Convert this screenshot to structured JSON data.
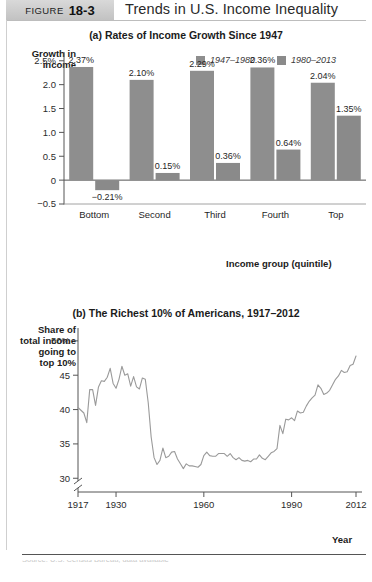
{
  "figure": {
    "tag_word": "FIGURE",
    "tag_number": "18-3",
    "title": "Trends in U.S. Income Inequality"
  },
  "panel_a": {
    "title": "(a) Rates of Income Growth Since 1947",
    "ylabel": "Growth in\nincome",
    "ylabel_line1": "Growth in",
    "ylabel_line2": "income",
    "xlabel": "Income group (quintile)",
    "legend": [
      {
        "label": "1947–1980",
        "color": "#8e8e8e"
      },
      {
        "label": "1980–2013",
        "color": "#8a8a8a"
      }
    ]
  },
  "panel_b": {
    "title": "(b) The Richest 10% of Americans, 1917–2012",
    "ylabel_line1": "Share of",
    "ylabel_line2": "total income",
    "ylabel_line3": "going to",
    "ylabel_line4": "top 10%",
    "xlabel": "Year"
  },
  "source": {
    "text": "Source: U.S. Census Bureau; data available"
  },
  "chart_data": [
    {
      "type": "bar",
      "title": "(a) Rates of Income Growth Since 1947",
      "xlabel": "Income group (quintile)",
      "ylabel": "Growth in income",
      "categories": [
        "Bottom",
        "Second",
        "Third",
        "Fourth",
        "Top"
      ],
      "series": [
        {
          "name": "1947–1980",
          "color": "#8e8e8e",
          "values": [
            2.37,
            2.1,
            2.29,
            2.36,
            2.04
          ],
          "labels": [
            "2.37%",
            "2.10%",
            "2.29%",
            "2.36%",
            "2.04%"
          ]
        },
        {
          "name": "1980–2013",
          "color": "#8a8a8a",
          "values": [
            -0.21,
            0.15,
            0.36,
            0.64,
            1.35
          ],
          "labels": [
            "−0.21%",
            "0.15%",
            "0.36%",
            "0.64%",
            "1.35%"
          ]
        }
      ],
      "ylim": [
        -0.5,
        2.6
      ],
      "yticks": [
        -0.5,
        0,
        0.5,
        1.0,
        1.5,
        2.0,
        2.5
      ],
      "ytick_labels": [
        "−0.5",
        "0",
        "0.5",
        "1.0",
        "1.5",
        "2.0",
        "2.5%"
      ],
      "grid": false,
      "legend_position": "top-right"
    },
    {
      "type": "line",
      "title": "(b) The Richest 10% of Americans, 1917–2012",
      "xlabel": "Year",
      "ylabel": "Share of total income going to top 10%",
      "ylim": [
        28,
        51
      ],
      "yticks": [
        30,
        35,
        40,
        45,
        50
      ],
      "ytick_labels": [
        "30",
        "35",
        "40",
        "45",
        "50%"
      ],
      "axis_break": true,
      "xlim": [
        1917,
        2012
      ],
      "xticks": [
        1917,
        1930,
        1960,
        1990,
        2012
      ],
      "xtick_labels": [
        "1917",
        "1930",
        "1960",
        "1990",
        "2012"
      ],
      "grid": false,
      "line_color": "#9a9a9a",
      "x": [
        1917,
        1918,
        1919,
        1920,
        1921,
        1922,
        1923,
        1924,
        1925,
        1926,
        1927,
        1928,
        1929,
        1930,
        1931,
        1932,
        1933,
        1934,
        1935,
        1936,
        1937,
        1938,
        1939,
        1940,
        1941,
        1942,
        1943,
        1944,
        1945,
        1946,
        1947,
        1948,
        1949,
        1950,
        1951,
        1952,
        1953,
        1954,
        1955,
        1956,
        1957,
        1958,
        1959,
        1960,
        1961,
        1962,
        1963,
        1964,
        1965,
        1966,
        1967,
        1968,
        1969,
        1970,
        1971,
        1972,
        1973,
        1974,
        1975,
        1976,
        1977,
        1978,
        1979,
        1980,
        1981,
        1982,
        1983,
        1984,
        1985,
        1986,
        1987,
        1988,
        1989,
        1990,
        1991,
        1992,
        1993,
        1994,
        1995,
        1996,
        1997,
        1998,
        1999,
        2000,
        2001,
        2002,
        2003,
        2004,
        2005,
        2006,
        2007,
        2008,
        2009,
        2010,
        2011,
        2012
      ],
      "y": [
        40.3,
        39.9,
        39.5,
        38.1,
        42.9,
        42.9,
        40.6,
        43.3,
        44.2,
        44.1,
        44.7,
        46.0,
        43.8,
        43.1,
        44.4,
        46.3,
        45.0,
        45.2,
        43.4,
        44.8,
        43.3,
        43.0,
        44.6,
        44.4,
        41.0,
        36.0,
        33.0,
        32.0,
        32.6,
        34.4,
        33.0,
        33.2,
        33.8,
        33.9,
        32.8,
        32.1,
        31.4,
        32.1,
        31.8,
        31.8,
        31.7,
        31.6,
        32.0,
        33.3,
        33.8,
        33.3,
        33.2,
        33.2,
        33.6,
        33.6,
        33.6,
        33.2,
        33.6,
        33.0,
        32.7,
        33.0,
        32.6,
        32.5,
        32.6,
        32.4,
        32.8,
        32.8,
        33.4,
        32.9,
        32.7,
        33.2,
        33.7,
        33.9,
        34.3,
        37.7,
        36.5,
        38.6,
        38.5,
        38.8,
        38.4,
        39.8,
        39.5,
        39.6,
        40.5,
        41.2,
        41.7,
        42.1,
        43.6,
        43.1,
        42.2,
        42.4,
        42.8,
        43.6,
        44.4,
        44.9,
        45.7,
        45.4,
        45.5,
        46.4,
        46.6,
        47.8
      ]
    }
  ]
}
